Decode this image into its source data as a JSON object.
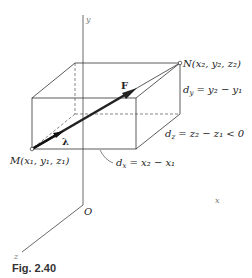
{
  "figure": {
    "caption": "Fig. 2.40",
    "axes": {
      "x_label": "x",
      "y_label": "y",
      "z_label": "z",
      "origin_label": "O"
    },
    "points": {
      "M": "M(x₁, y₁, z₁)",
      "N": "N(x₂, y₂, z₂)"
    },
    "vectors": {
      "force": "F",
      "unit": "λ"
    },
    "dimensions": {
      "dx": "dₓ = x₂ − x₁",
      "dy": "dᵧ = y₂ − y₁",
      "dz": "d₂ = z₂ − z₁ < 0"
    },
    "dimension_parts": {
      "dx_sym": "d",
      "dx_sub": "x",
      "dx_rhs": " = x₂ − x₁",
      "dy_sym": "d",
      "dy_sub": "y",
      "dy_rhs": " = y₂ − y₁",
      "dz_sym": "d",
      "dz_sub": "z",
      "dz_rhs": " = z₂ − z₁ < 0"
    },
    "colors": {
      "line": "#333333",
      "axis": "#555555",
      "x_axis": "#888888"
    }
  }
}
